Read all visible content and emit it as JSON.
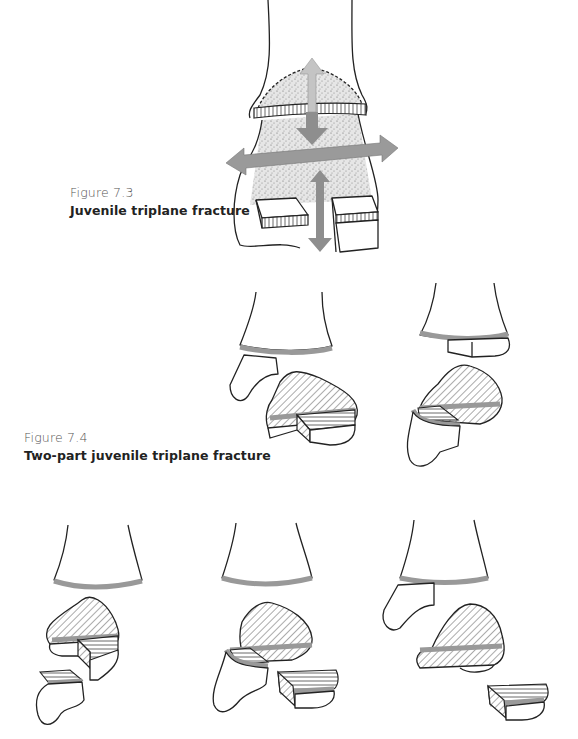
{
  "figures": [
    {
      "number": "Figure 7.3",
      "title": "Juvenile triplane fracture",
      "illustration": "Ankle diagram with distal tibia, stippled epiphysis, hatched physis, two block fragments and directional arrows (up, down, left, right, vertical through split)"
    },
    {
      "number": "Figure 7.4",
      "title": "Two-part juvenile triplane fracture",
      "illustration": "Two sketches of a distal tibia separated from a hatched epiphyseal fragment with gray physeal band"
    },
    {
      "number": "",
      "title": "",
      "illustration": "Three sketches of three-part triplane fracture: tibial shaft, hatched epiphysis, separated fragments"
    }
  ],
  "colors": {
    "arrow_light": "#c4c4c4",
    "arrow_dark": "#8e8e8e",
    "physis_band": "#9a9a9a",
    "stipple": "#d8d8d8",
    "line": "#222222"
  }
}
